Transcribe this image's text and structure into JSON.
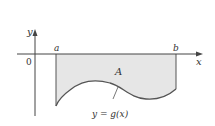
{
  "diagram": {
    "type": "area-between-curve-and-axis",
    "axes": {
      "x_label": "x",
      "y_label": "y",
      "origin_label": "0"
    },
    "bounds": {
      "left_label": "a",
      "right_label": "b"
    },
    "region_label": "A",
    "curve_label": "y = g(x)",
    "colors": {
      "fill": "#e6e6e6",
      "curve": "#555555",
      "axis": "#444444"
    }
  }
}
